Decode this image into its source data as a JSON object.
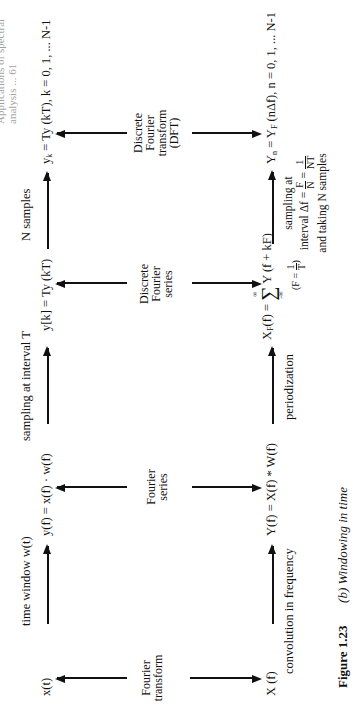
{
  "running_header": "Applications of spectral analysis ... 61",
  "top_row": {
    "x_t": "x(t)",
    "y_f_time": "y(f) = x(f) · w(f)",
    "y_k_bracket": "y[k] = Ty (kT)",
    "y_k_sub": {
      "base": "y",
      "sub": "k",
      "rest": " = Ty (kT),   k = 0, 1, ... N-1"
    }
  },
  "top_arrow_labels": {
    "time_window": "time window  w(t)",
    "sampling": "sampling at interval T",
    "n_samples": "N samples"
  },
  "transform_labels": {
    "fourier_transform": [
      "Fourier",
      "transform"
    ],
    "fourier_series": [
      "Fourier",
      "series"
    ],
    "discrete_fourier_series": [
      "Discrete",
      "Fourier",
      "series"
    ],
    "dft": [
      "Discrete",
      "Fourier",
      "transform",
      "(DFT)"
    ]
  },
  "bottom_row": {
    "X_f": "X (f)",
    "Y_f": "Y(f) = X(f) * W(f)",
    "X_F": {
      "lhs_base": "X",
      "lhs_sub": "F",
      "lhs_rest": "(f) = ",
      "sum_upper": "∞",
      "sum_lower": "-∞",
      "rhs": "Y (f + kF)",
      "note_prefix": "F = ",
      "note_num": "1",
      "note_den": "T"
    },
    "Y_n": {
      "base": "Y",
      "sub": "n",
      "mid": " = Y",
      "mid_sub": "F",
      "rest": " (nΔf),   n = 0, 1, ... N-1"
    }
  },
  "bottom_arrow_labels": {
    "convolution": "convolution in frequency",
    "periodization": "periodization",
    "sampling_freq": {
      "line1": "sampling at",
      "line2_prefix": "interval  Δf = ",
      "frac1_num": "F",
      "frac1_den": "N",
      "eq": " = ",
      "frac2_num": "1",
      "frac2_den": "NT",
      "line3": "and taking N samples"
    }
  },
  "caption": {
    "figure_label": "Figure 1.23",
    "text": "(b)  Windowing in time"
  }
}
